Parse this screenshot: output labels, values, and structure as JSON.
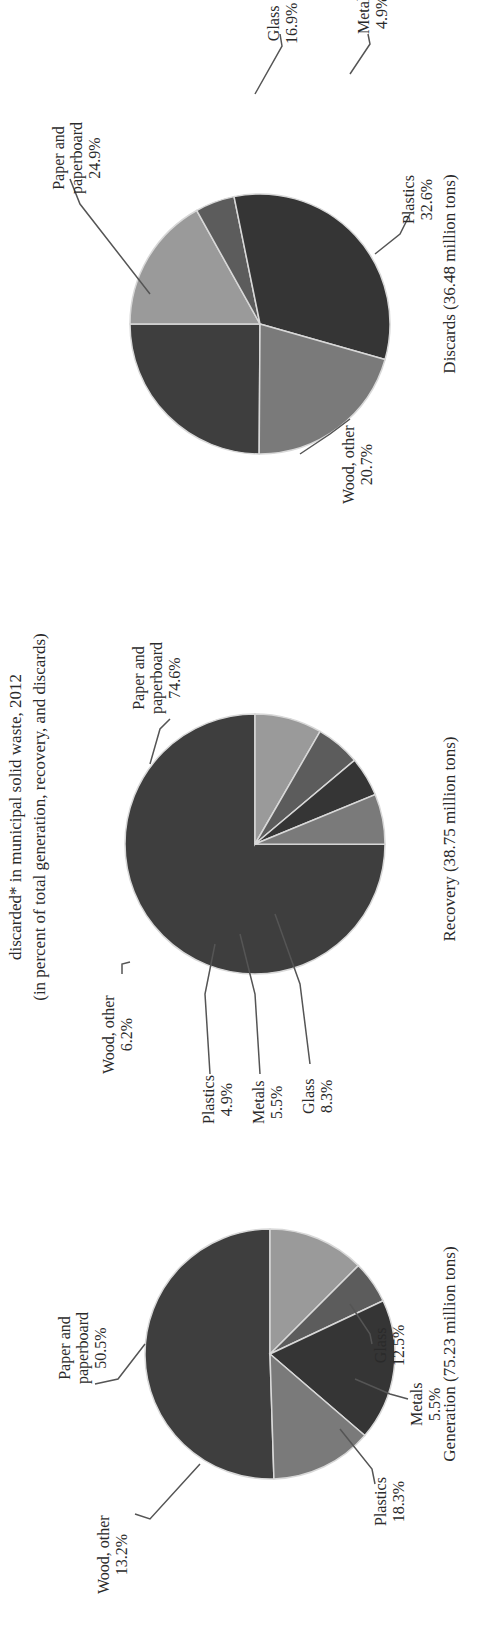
{
  "title": {
    "line1": "discarded* in municipal solid waste, 2012",
    "line2": "(in percent of total generation, recovery, and discards)"
  },
  "colors": {
    "paper": "#3e3e3e",
    "wood": "#7a7a7a",
    "plastics": "#353535",
    "metals": "#5c5c5c",
    "glass": "#9a9a9a",
    "separator": "#d8d8d8"
  },
  "charts": [
    {
      "caption": "Generation (75.23 million tons)",
      "labels": {
        "paper": [
          "Paper and",
          "paperboard",
          "50.5%"
        ],
        "wood": [
          "Wood, other",
          "13.2%"
        ],
        "plastics": [
          "Plastics",
          "18.3%"
        ],
        "metals": [
          "Metals",
          "5.5%"
        ],
        "glass": [
          "Glass",
          "12.5%"
        ]
      }
    },
    {
      "caption": "Recovery (38.75 million tons)",
      "labels": {
        "paper": [
          "Paper and",
          "paperboard",
          "74.6%"
        ],
        "wood": [
          "Wood, other",
          "6.2%"
        ],
        "plastics": [
          "Plastics",
          "4.9%"
        ],
        "metals": [
          "Metals",
          "5.5%"
        ],
        "glass": [
          "Glass",
          "8.3%"
        ]
      }
    },
    {
      "caption": "Discards (36.48 million tons)",
      "labels": {
        "paper": [
          "Paper and",
          "paperboard",
          "24.9%"
        ],
        "wood": [
          "Wood, other",
          "20.7%"
        ],
        "plastics": [
          "Plastics",
          "32.6%"
        ],
        "metals": [
          "Metals",
          "4.9%"
        ],
        "glass": [
          "Glass",
          "16.9%"
        ]
      }
    }
  ],
  "chart_data": [
    {
      "type": "pie",
      "title": "Generation (75.23 million tons)",
      "categories": [
        "Paper and paperboard",
        "Wood, other",
        "Plastics",
        "Metals",
        "Glass"
      ],
      "values": [
        50.5,
        13.2,
        18.3,
        5.5,
        12.5
      ],
      "unit": "%"
    },
    {
      "type": "pie",
      "title": "Recovery (38.75 million tons)",
      "categories": [
        "Paper and paperboard",
        "Wood, other",
        "Plastics",
        "Metals",
        "Glass"
      ],
      "values": [
        74.6,
        6.2,
        4.9,
        5.5,
        8.3
      ],
      "unit": "%"
    },
    {
      "type": "pie",
      "title": "Discards (36.48 million tons)",
      "categories": [
        "Paper and paperboard",
        "Wood, other",
        "Plastics",
        "Metals",
        "Glass"
      ],
      "values": [
        24.9,
        20.7,
        32.6,
        4.9,
        16.9
      ],
      "unit": "%"
    }
  ]
}
